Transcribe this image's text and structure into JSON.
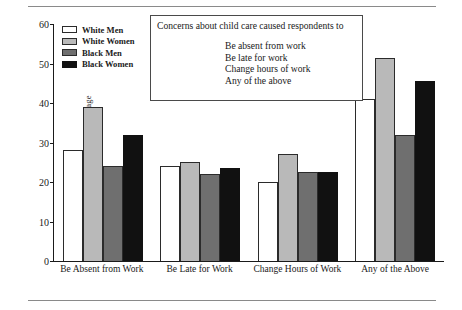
{
  "chart_data": {
    "type": "bar",
    "title": "",
    "xlabel": "",
    "ylabel": "Percentage",
    "ylim": [
      0,
      60
    ],
    "yticks": [
      0,
      10,
      20,
      30,
      40,
      50,
      60
    ],
    "grid": false,
    "legend_position": "upper-left-inside",
    "categories": [
      "Be Absent from Work",
      "Be Late for Work",
      "Change Hours of Work",
      "Any of the Above"
    ],
    "series": [
      {
        "name": "White Men",
        "color": "#ffffff",
        "values": [
          28,
          24,
          20,
          41
        ]
      },
      {
        "name": "White Women",
        "color": "#b9b9b9",
        "values": [
          39,
          25,
          27,
          51.5
        ]
      },
      {
        "name": "Black Men",
        "color": "#6f6f6f",
        "values": [
          24,
          22,
          22.5,
          32
        ]
      },
      {
        "name": "Black Women",
        "color": "#111111",
        "values": [
          32,
          23.5,
          22.5,
          45.5
        ]
      }
    ],
    "annotation": {
      "heading": "Concerns about child care caused respondents to",
      "items": [
        "Be absent from work",
        "Be late for work",
        "Change hours of work",
        "Any of the above"
      ]
    }
  }
}
